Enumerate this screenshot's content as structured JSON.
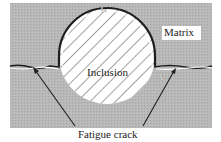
{
  "diagram": {
    "labels": {
      "matrix": "Matrix",
      "inclusion": "Inclusion",
      "point_c": "C",
      "point_a": "A",
      "caption": "Fatigue crack"
    },
    "colors": {
      "matrix_fill": "#b4b4b4",
      "inclusion_fill": "#ffffff",
      "outline": "#1e1e1e",
      "hatch": "#444444"
    }
  }
}
